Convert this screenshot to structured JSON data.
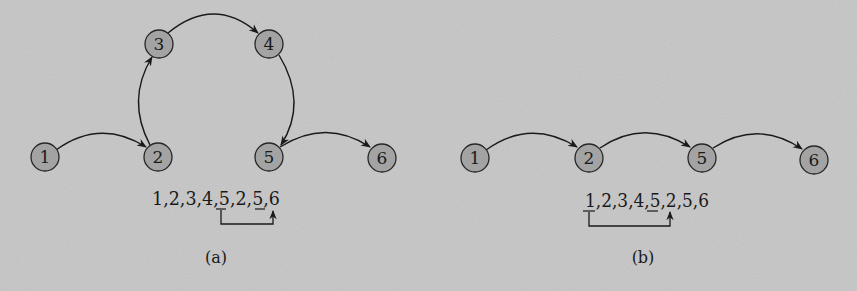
{
  "colors": {
    "background": "#c9c9c9",
    "node_fill": "#a3a3a3",
    "node_stroke": "#262626",
    "edge": "#1a1a1a",
    "text": "#1a1a1a"
  },
  "panels": [
    {
      "id": "a",
      "caption": "(a)",
      "nodes": [
        {
          "id": "1",
          "label": "1",
          "x": 45,
          "y": 157
        },
        {
          "id": "2",
          "label": "2",
          "x": 158,
          "y": 157
        },
        {
          "id": "3",
          "label": "3",
          "x": 159,
          "y": 44
        },
        {
          "id": "4",
          "label": "4",
          "x": 269,
          "y": 44
        },
        {
          "id": "5",
          "label": "5",
          "x": 269,
          "y": 157
        },
        {
          "id": "6",
          "label": "6",
          "x": 382,
          "y": 158
        }
      ],
      "edges": [
        {
          "from": "1",
          "to": "2"
        },
        {
          "from": "2",
          "to": "3"
        },
        {
          "from": "3",
          "to": "4"
        },
        {
          "from": "4",
          "to": "5"
        },
        {
          "from": "5",
          "to": "6"
        }
      ],
      "sequence": {
        "text": "1,2,3,4,5,2,5,6",
        "underlined_items": [
          "5 (5th item)",
          "5 (7th item)"
        ],
        "jump": {
          "from_index": 4,
          "to_index": 7,
          "description": "jump from first 5 to 6"
        }
      }
    },
    {
      "id": "b",
      "caption": "(b)",
      "nodes": [
        {
          "id": "1",
          "label": "1",
          "x": 475,
          "y": 158
        },
        {
          "id": "2",
          "label": "2",
          "x": 589,
          "y": 158
        },
        {
          "id": "5",
          "label": "5",
          "x": 702,
          "y": 158
        },
        {
          "id": "6",
          "label": "6",
          "x": 814,
          "y": 160
        }
      ],
      "edges": [
        {
          "from": "1",
          "to": "2"
        },
        {
          "from": "2",
          "to": "5"
        },
        {
          "from": "5",
          "to": "6"
        }
      ],
      "sequence": {
        "text": "1,2,3,4,5,2,5,6",
        "underlined_items": [
          "1 (1st item)",
          "5 (5th item)"
        ],
        "jump": {
          "from_index": 0,
          "to_index": 5,
          "description": "jump from 1 to second 2"
        }
      }
    }
  ]
}
